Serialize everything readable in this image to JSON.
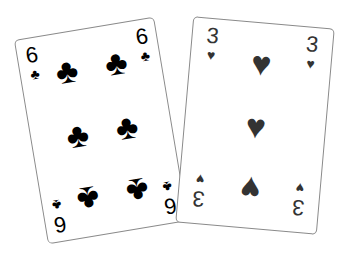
{
  "cards": [
    {
      "rank": "6",
      "suit": "clubs",
      "suit_symbol": "♣",
      "color": "#000000",
      "pip_count": 6
    },
    {
      "rank": "3",
      "suit": "hearts",
      "suit_symbol": "♥",
      "color": "#333333",
      "pip_count": 3
    }
  ]
}
